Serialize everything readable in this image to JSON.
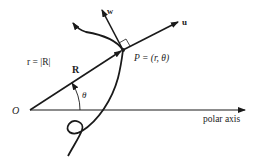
{
  "diagram": {
    "type": "polar-coordinates-vector-diagram",
    "colors": {
      "stroke": "#1a1a1a",
      "text": "#222222",
      "background": "#ffffff"
    },
    "labels": {
      "origin": "O",
      "radius_def": "r = |R|",
      "position_vector": "R",
      "point": "P = (r, θ)",
      "angle": "θ",
      "unit_u": "u",
      "unit_w": "w",
      "axis": "polar axis"
    },
    "elements": [
      {
        "name": "polar-axis",
        "from": [
          30,
          110
        ],
        "to": [
          245,
          110
        ],
        "arrow": true
      },
      {
        "name": "position-vector-R",
        "from": [
          30,
          110
        ],
        "to": [
          123,
          50
        ],
        "arrow": true
      },
      {
        "name": "unit-vector-u",
        "from": [
          123,
          50
        ],
        "to": [
          178,
          22
        ],
        "arrow": true
      },
      {
        "name": "unit-vector-w",
        "from": [
          123,
          50
        ],
        "to": [
          102,
          10
        ],
        "arrow": true
      },
      {
        "name": "curve",
        "passes_through": "P",
        "arrow_end": [
          72,
          22
        ],
        "has_loop": true
      },
      {
        "name": "angle-arc",
        "center": [
          30,
          110
        ],
        "radius": 50
      },
      {
        "name": "right-angle-marker",
        "at": "P"
      }
    ]
  }
}
